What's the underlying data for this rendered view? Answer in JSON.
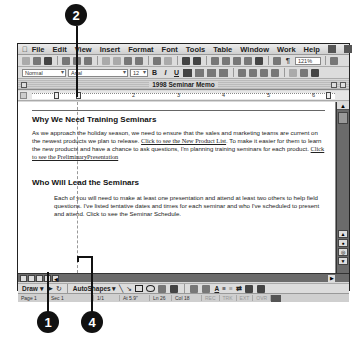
{
  "menubar": {
    "items": [
      "File",
      "Edit",
      "View",
      "Insert",
      "Format",
      "Font",
      "Tools",
      "Table",
      "Window",
      "Work",
      "Help"
    ]
  },
  "toolbar": {
    "zoom": "121%"
  },
  "formatting": {
    "style": "Normal",
    "font": "Arial",
    "size": "12",
    "bold": "B",
    "italic": "I",
    "underline": "U"
  },
  "window": {
    "title": "1998 Seminar Memo"
  },
  "ruler": {
    "numbers": [
      "1",
      "2",
      "3",
      "4",
      "5",
      "6"
    ]
  },
  "document": {
    "heading1": "Why We Need Training  Seminars",
    "para1_text1": "As we approach the holiday season,  we  need to ensure  that the sales  and  marketing teams  are current on the newest  products  we plan to release.",
    "para1_link1": "Click to see the New Product List",
    "para1_text2": ". To make  it easier  for them to learn the new products  and have a chance to ask questions,  I'm planning training  seminars   for each product.",
    "para1_link2": "Click to see the PreliminaryPresentation",
    "heading2": "Who Will Lead the Seminars",
    "para2": "Each of you will  need to make  at least one presentation  and  attend at least two others to help field  questions.  I've listed tentative dates  and times for each seminar  and  who  I've scheduled to present  and attend. Click to see the Seminar  Schedule."
  },
  "drawbar": {
    "draw_label": "Draw",
    "autoshapes_label": "AutoShapes"
  },
  "statusbar": {
    "page": "Page  1",
    "sec": "Sec  1",
    "pages": "1/1",
    "at": "At  5.9\"",
    "ln": "Ln  26",
    "col": "Col  18",
    "rec": "REC",
    "trk": "TRK",
    "ext": "EXT",
    "ovr": "OVR"
  },
  "callouts": {
    "c1": "1",
    "c2": "2",
    "c4": "4"
  }
}
